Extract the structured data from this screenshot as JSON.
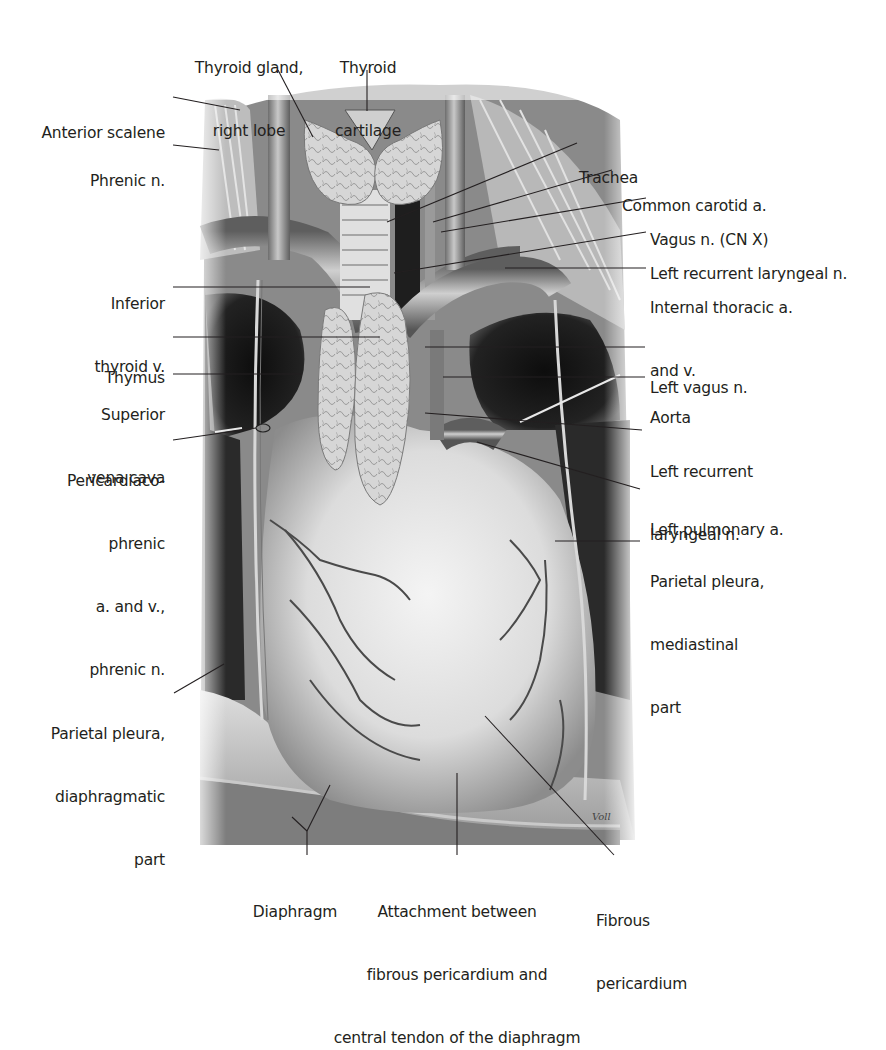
{
  "figure": {
    "artist_signature": "Voll",
    "colors": {
      "background": "#ffffff",
      "text": "#231f20",
      "leader_line": "#231f20",
      "dark_cavity": "#161616",
      "tissue_light": "#e6e6e6",
      "tissue_mid": "#a9a9a9",
      "tissue_dark": "#5a5a5a"
    }
  },
  "labels": {
    "thyroid_gland_right_lobe": {
      "lines": [
        "Thyroid gland,",
        "right lobe"
      ]
    },
    "thyroid_cartilage": {
      "lines": [
        "Thyroid",
        "cartilage"
      ]
    },
    "anterior_scalene": {
      "lines": [
        "Anterior scalene"
      ]
    },
    "phrenic_n": {
      "lines": [
        "Phrenic n."
      ]
    },
    "trachea": {
      "lines": [
        "Trachea"
      ]
    },
    "common_carotid_a": {
      "lines": [
        "Common carotid a."
      ]
    },
    "vagus_n_cn_x": {
      "lines": [
        "Vagus n. (CN X)"
      ]
    },
    "left_recurrent_laryngeal_n_upper": {
      "lines": [
        "Left recurrent laryngeal n."
      ]
    },
    "internal_thoracic_a_v": {
      "lines": [
        "Internal thoracic a.",
        "and v."
      ]
    },
    "inferior_thyroid_v": {
      "lines": [
        "Inferior",
        "thyroid v."
      ]
    },
    "thymus": {
      "lines": [
        "Thymus"
      ]
    },
    "superior_vena_cava": {
      "lines": [
        "Superior",
        "vena cava"
      ]
    },
    "pericardiacophrenic": {
      "lines": [
        "Pericardiaco-",
        "phrenic",
        "a. and v.,",
        "phrenic n."
      ]
    },
    "left_vagus_n": {
      "lines": [
        "Left vagus n."
      ]
    },
    "aorta": {
      "lines": [
        "Aorta"
      ]
    },
    "left_recurrent_laryngeal_n_lower": {
      "lines": [
        "Left recurrent",
        "laryngeal n."
      ]
    },
    "left_pulmonary_a": {
      "lines": [
        "Left pulmonary a."
      ]
    },
    "parietal_pleura_mediastinal": {
      "lines": [
        "Parietal pleura,",
        "mediastinal",
        "part"
      ]
    },
    "parietal_pleura_diaphragmatic": {
      "lines": [
        "Parietal pleura,",
        "diaphragmatic",
        "part"
      ]
    },
    "diaphragm": {
      "lines": [
        "Diaphragm"
      ]
    },
    "attachment": {
      "lines": [
        "Attachment between",
        "fibrous pericardium and",
        "central tendon of the diaphragm"
      ]
    },
    "fibrous_pericardium": {
      "lines": [
        "Fibrous",
        "pericardium"
      ]
    }
  }
}
